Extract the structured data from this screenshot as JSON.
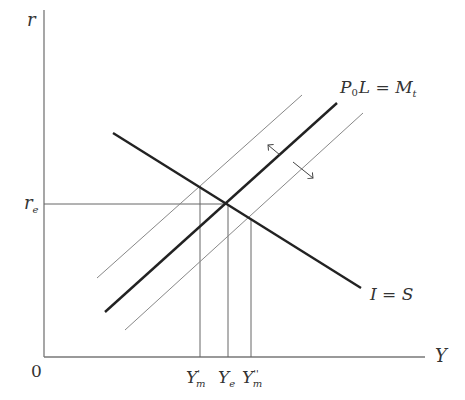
{
  "diagram": {
    "axes": {
      "y_label": "r",
      "x_label": "Y",
      "origin_label": "0"
    },
    "curves": {
      "money_market": {
        "label_main": "P",
        "label_sub": "0",
        "label_rest": "L = M",
        "label_rest_sub": "t"
      },
      "is_curve": {
        "label": "I = S"
      }
    },
    "levels": {
      "r_e": {
        "main": "r",
        "sub": "e"
      }
    },
    "x_marks": [
      {
        "id": "Y_m_prime",
        "main": "Y",
        "sup": "'",
        "sub": "m"
      },
      {
        "id": "Y_e",
        "main": "Y",
        "sup": "",
        "sub": "e"
      },
      {
        "id": "Y_m_double_prime",
        "main": "Y",
        "sup": "''",
        "sub": "m"
      }
    ],
    "colors": {
      "axis": "#777777",
      "thick_line": "#222222",
      "thin_line": "#888888",
      "guide": "#666666"
    }
  }
}
